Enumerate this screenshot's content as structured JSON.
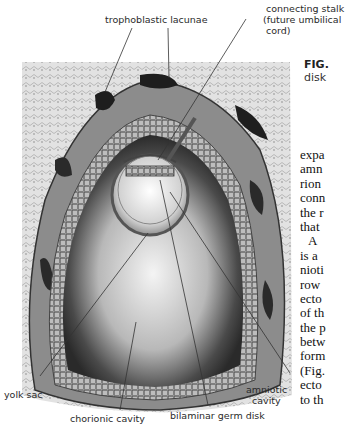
{
  "figure": {
    "labels": {
      "trophoblastic_lacunae": "trophoblastic lacunae",
      "connecting_stalk_1": "connecting stalk",
      "connecting_stalk_2": "(future umbilical",
      "connecting_stalk_3": "cord)",
      "yolk_sac": "yolk sac",
      "chorionic_cavity": "chorionic cavity",
      "bilaminar_germ_disk": "bilaminar germ disk",
      "amniotic_cavity_1": "amniotic",
      "amniotic_cavity_2": "cavity"
    },
    "colors": {
      "decidua": "#d9d9d9",
      "trophoblast": "#8a8a8a",
      "cavity": "#5a5a5a",
      "yolk_sac": "#e8e8e8"
    }
  },
  "caption": {
    "prefix": "FIG.",
    "line2": "disk"
  },
  "body_text": {
    "lines": [
      "expa",
      "amn",
      "rion",
      "conn",
      "the r",
      "that",
      "A",
      "is a",
      "nioti",
      "row",
      "ecto",
      "of th",
      "the p",
      "betw",
      "form",
      "(Fig.",
      "ecto",
      "to th"
    ]
  }
}
